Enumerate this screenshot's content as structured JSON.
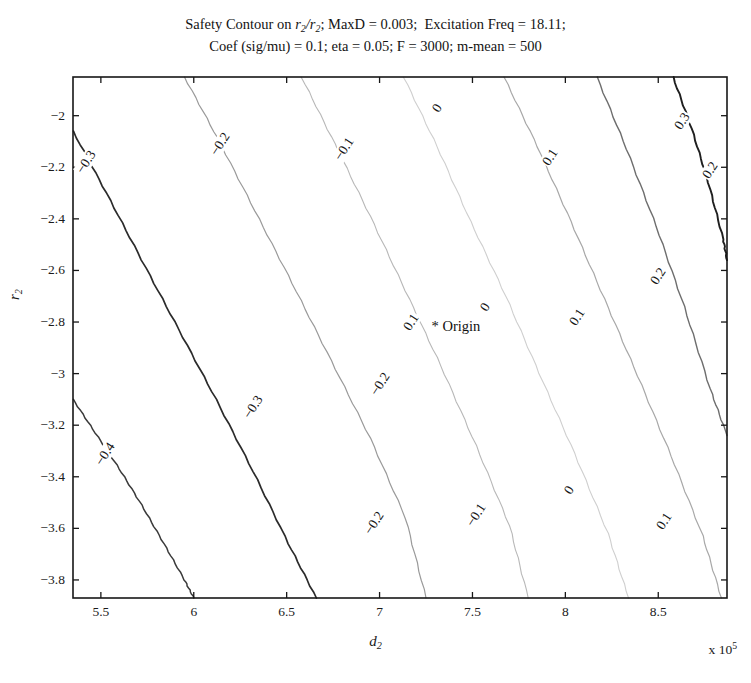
{
  "figure": {
    "title_line1_pre": "Safety Contour on ",
    "title_line1_rr": "r",
    "title_line1_rr_sub": "2",
    "title_line1_slash": "/",
    "title_line1_rr2": "r",
    "title_line1_rr2_sub": "2",
    "title_line1_post": "; MaxD = 0.003;  Excitation Freq = 18.11;",
    "title_line2": "Coef (sig/mu) = 0.1; eta = 0.05; F = 3000; m-mean = 500",
    "origin_label": "* Origin"
  },
  "axes": {
    "xlabel_sym": "d",
    "xlabel_sub": "2",
    "ylabel_sym": "r",
    "ylabel_sub": "2",
    "x_multiplier_pre": "x 10",
    "x_multiplier_exp": "5",
    "xticks": [
      "5.5",
      "6",
      "6.5",
      "7",
      "7.5",
      "8",
      "8.5"
    ],
    "xtick_values": [
      5.5,
      6.0,
      6.5,
      7.0,
      7.5,
      8.0,
      8.5
    ],
    "yticks": [
      "-2",
      "-2.2",
      "-2.4",
      "-2.6",
      "-2.8",
      "-3",
      "-3.2",
      "-3.4",
      "-3.6",
      "-3.8"
    ],
    "ytick_values": [
      -2.0,
      -2.2,
      -2.4,
      -2.6,
      -2.8,
      -3.0,
      -3.2,
      -3.4,
      -3.6,
      -3.8
    ],
    "xlim": [
      5.35,
      8.87
    ],
    "ylim": [
      -3.87,
      -1.85
    ],
    "grid": false,
    "box": true
  },
  "chart_data": {
    "type": "line",
    "plot_kind": "contour",
    "title": "Safety Contour on r2/r2; MaxD = 0.003;  Excitation Freq = 18.11; Coef (sig/mu) = 0.1; eta = 0.05; F = 3000; m-mean = 500",
    "xlabel": "d_2  (x 10^5)",
    "ylabel": "r_2",
    "xlim": [
      5.35,
      8.87
    ],
    "ylim": [
      -3.87,
      -1.85
    ],
    "legend": null,
    "levels": [
      -0.4,
      -0.3,
      -0.2,
      -0.1,
      0,
      0.1,
      0.2,
      0.3
    ],
    "level_labels": [
      "-0.4",
      "-0.3",
      "-0.2",
      "-0.1",
      "0",
      "0.1",
      "0.2",
      "0.3"
    ],
    "annotations": [
      {
        "text": "* Origin",
        "x": 7.28,
        "y": -2.82
      }
    ],
    "series": [
      {
        "name": "-0.4",
        "level": -0.4,
        "color": "#3a3a3a",
        "width": 1.5,
        "x": [
          5.35,
          5.47,
          5.6,
          5.72,
          5.84,
          5.95,
          6.0
        ],
        "y": [
          -3.1,
          -3.23,
          -3.37,
          -3.51,
          -3.66,
          -3.8,
          -3.87
        ]
      },
      {
        "name": "-0.3",
        "level": -0.3,
        "color": "#2b2b2b",
        "width": 1.7,
        "x": [
          5.35,
          5.53,
          5.72,
          5.92,
          6.12,
          6.32,
          6.51,
          6.66
        ],
        "y": [
          -2.06,
          -2.3,
          -2.56,
          -2.83,
          -3.1,
          -3.38,
          -3.66,
          -3.87
        ]
      },
      {
        "name": "-0.2",
        "level": -0.2,
        "color": "#9a9a9a",
        "width": 1.2,
        "x": [
          5.95,
          6.13,
          6.33,
          6.53,
          6.74,
          6.95,
          7.14,
          7.25
        ],
        "y": [
          -1.85,
          -2.09,
          -2.37,
          -2.65,
          -2.95,
          -3.25,
          -3.56,
          -3.87
        ]
      },
      {
        "name": "-0.1",
        "level": -0.1,
        "color": "#b8b8b8",
        "width": 1.1,
        "x": [
          6.58,
          6.76,
          6.95,
          7.14,
          7.33,
          7.52,
          7.7,
          7.8
        ],
        "y": [
          -1.85,
          -2.11,
          -2.39,
          -2.68,
          -2.97,
          -3.28,
          -3.59,
          -3.87
        ]
      },
      {
        "name": "0",
        "level": 0,
        "color": "#cfcfcf",
        "width": 1.1,
        "x": [
          7.13,
          7.31,
          7.49,
          7.68,
          7.86,
          8.05,
          8.23,
          8.34
        ],
        "y": [
          -1.85,
          -2.12,
          -2.41,
          -2.7,
          -3.0,
          -3.31,
          -3.62,
          -3.87
        ]
      },
      {
        "name": "0.1",
        "level": 0.1,
        "color": "#a8a8a8",
        "width": 1.2,
        "x": [
          7.67,
          7.85,
          8.03,
          8.21,
          8.39,
          8.57,
          8.74,
          8.84
        ],
        "y": [
          -1.85,
          -2.12,
          -2.41,
          -2.71,
          -3.01,
          -3.32,
          -3.63,
          -3.87
        ]
      },
      {
        "name": "0.2",
        "level": 0.2,
        "color": "#6e6e6e",
        "width": 1.4,
        "x": [
          8.17,
          8.33,
          8.49,
          8.64,
          8.78,
          8.87
        ],
        "y": [
          -1.85,
          -2.13,
          -2.43,
          -2.74,
          -3.06,
          -3.24
        ]
      },
      {
        "name": "0.3",
        "level": 0.3,
        "color": "#1f1f1f",
        "width": 1.9,
        "x": [
          8.58,
          8.68,
          8.77,
          8.85,
          8.87
        ],
        "y": [
          -1.85,
          -2.05,
          -2.26,
          -2.48,
          -2.56
        ]
      }
    ],
    "inline_labels": [
      {
        "text": "-0.3",
        "x": 5.42,
        "y": -2.18,
        "rotation": 57
      },
      {
        "text": "-0.2",
        "x": 6.14,
        "y": -2.11,
        "rotation": 57
      },
      {
        "text": "-0.1",
        "x": 6.81,
        "y": -2.13,
        "rotation": 57
      },
      {
        "text": "0",
        "x": 7.31,
        "y": -1.97,
        "rotation": 57
      },
      {
        "text": "0.1",
        "x": 7.92,
        "y": -2.16,
        "rotation": 57
      },
      {
        "text": "0.3",
        "x": 8.63,
        "y": -2.02,
        "rotation": 57
      },
      {
        "text": "-0.4",
        "x": 5.52,
        "y": -3.31,
        "rotation": 57
      },
      {
        "text": "-0.3",
        "x": 6.32,
        "y": -3.13,
        "rotation": 57
      },
      {
        "text": "-0.2",
        "x": 7.0,
        "y": -3.04,
        "rotation": 57
      },
      {
        "text": "0",
        "x": 7.57,
        "y": -2.74,
        "rotation": 57
      },
      {
        "text": "0.1",
        "x": 8.06,
        "y": -2.78,
        "rotation": 57
      },
      {
        "text": "0.2",
        "x": 8.5,
        "y": -2.62,
        "rotation": 57
      },
      {
        "text": "-0.2",
        "x": 6.97,
        "y": -3.58,
        "rotation": 57
      },
      {
        "text": "-0.1",
        "x": 7.52,
        "y": -3.55,
        "rotation": 57
      },
      {
        "text": "0",
        "x": 8.02,
        "y": -3.45,
        "rotation": 57
      },
      {
        "text": "0.1",
        "x": 8.53,
        "y": -3.57,
        "rotation": 57
      },
      {
        "text": "0.2",
        "x": 8.78,
        "y": -2.21,
        "rotation": 57
      },
      {
        "text": "0.1",
        "x": 7.17,
        "y": -2.8,
        "rotation": 57
      }
    ]
  }
}
